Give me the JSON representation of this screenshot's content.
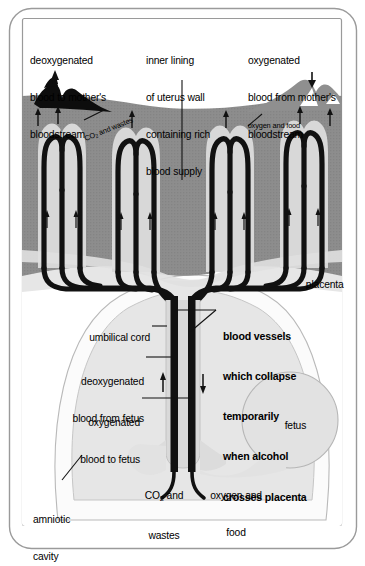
{
  "diagram": {
    "labels": {
      "deoxygenated_to_mother": "deoxygenated\nblood to mother's\nbloodstream",
      "inner_lining": "inner lining\nof uterus wall\ncontaining rich\nblood supply",
      "oxygenated_from_mother": "oxygenated\nblood from mother's\nbloodstream",
      "co2_and_wastes_villi": "CO₂ and wastes",
      "oxygen_and_food_villi": "oxygen and food",
      "placenta": "placenta",
      "umbilical_cord": "umbilical cord",
      "deoxygenated_from_fetus": "deoxygenated\nblood from fetus",
      "oxygenated_to_fetus": "oxygenated\nblood to fetus",
      "blood_vessels_collapse": "blood vessels\nwhich collapse\ntemporarily\nwhen alcohol\ncrosses placenta",
      "fetus": "fetus",
      "co2_and_wastes_bottom": "CO₂ and\nwastes",
      "oxygen_and_food_bottom": "oxygen and\nfood",
      "amniotic_cavity": "amniotic\ncavity"
    },
    "label_lines": {
      "deoxygenated_to_mother": [
        "deoxygenated",
        "blood to mother's",
        "bloodstream"
      ],
      "inner_lining": [
        "inner lining",
        "of uterus wall",
        "containing rich",
        "blood supply"
      ],
      "oxygenated_from_mother": [
        "oxygenated",
        "blood from mother's",
        "bloodstream"
      ],
      "deoxygenated_from_fetus": [
        "deoxygenated",
        "blood from fetus"
      ],
      "oxygenated_to_fetus": [
        "oxygenated",
        "blood to fetus"
      ],
      "blood_vessels_collapse": [
        "blood vessels",
        "which collapse",
        "temporarily",
        "when alcohol",
        "crosses placenta"
      ],
      "co2_and_wastes_bottom": [
        "CO",
        "2",
        " and",
        "wastes"
      ],
      "oxygen_and_food_bottom": [
        "oxygen and",
        "food"
      ],
      "amniotic_cavity": [
        "amniotic",
        "cavity"
      ]
    },
    "colors": {
      "frame": "#9a9a9a",
      "uterus_wall": "#8d8d8d",
      "villi_tissue": "#d4d4d4",
      "placenta_base": "#e2e2e2",
      "fetal_vessel": "#111111",
      "maternal_deoxy_vessel": "#0a0a0a",
      "maternal_oxy_vessel": "#8d8d8d",
      "amniotic_fluid": "#e4e4e4",
      "fetus_fill": "#e0e0e0",
      "background": "#ffffff",
      "text": "#000000",
      "outline": "#555555"
    },
    "structure": {
      "villi_count": 4,
      "maternal_vessel_left": "deoxygenated",
      "maternal_vessel_right": "oxygenated",
      "cord_vessel_left": "deoxygenated blood from fetus",
      "cord_vessel_right": "oxygenated blood to fetus",
      "arrow_direction_left_cord": "up",
      "arrow_direction_right_cord": "down"
    }
  }
}
